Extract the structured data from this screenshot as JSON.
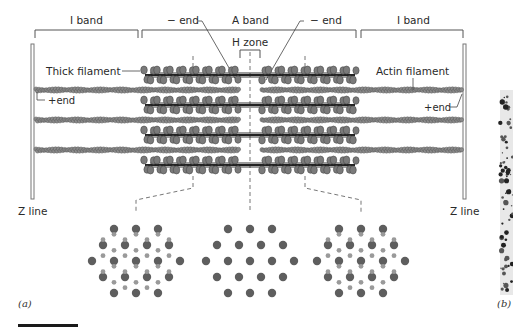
{
  "figure": {
    "panel_labels": {
      "a": "(a)",
      "b": "(b)"
    },
    "band_labels": {
      "i_band_left": "I band",
      "a_band": "A band",
      "i_band_right": "I band",
      "h_zone": "H zone"
    },
    "end_labels": {
      "minus_end_left": "− end",
      "minus_end_right": "− end",
      "plus_end_left": "+end",
      "plus_end_right": "+end"
    },
    "filament_labels": {
      "thick": "Thick filament",
      "actin": "Actin filament"
    },
    "z_line_labels": {
      "left": "Z line",
      "right": "Z line"
    },
    "cross_sections": [
      {
        "position": "overlap-left",
        "description": "thick + thin filaments hexagonal lattice"
      },
      {
        "position": "h-zone",
        "description": "thick filaments only"
      },
      {
        "position": "overlap-right",
        "description": "thick + thin filaments hexagonal lattice"
      }
    ],
    "colors": {
      "thick_filament": "#7a7a7a",
      "thin_filament": "#8a8a8a",
      "outline": "#4a4a4a",
      "background": "#ffffff"
    }
  }
}
